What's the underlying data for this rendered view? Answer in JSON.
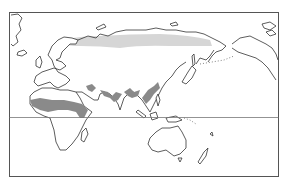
{
  "map": {
    "title": "",
    "projection": "world map, Eurasia-centered, Pacific on right",
    "frame": true,
    "equator_line": true,
    "regions": [
      {
        "name": "Sahel / Saharan belt (Africa)",
        "shade": "dark",
        "color": "#8a8a8a"
      },
      {
        "name": "Horn of Africa / Arabia fringe",
        "shade": "dark",
        "color": "#8a8a8a"
      },
      {
        "name": "South Asia / Indian subcontinent patches",
        "shade": "dark",
        "color": "#8a8a8a"
      },
      {
        "name": "Southeast Asia / South China patches",
        "shade": "dark",
        "color": "#8a8a8a"
      },
      {
        "name": "Northern Eurasia (Siberia) band",
        "shade": "light",
        "color": "#d6d6d6"
      }
    ],
    "colors": {
      "land_fill": "#ffffff",
      "coastline": "#333333",
      "dark_shade": "#8a8a8a",
      "light_shade": "#d6d6d6",
      "frame": "#555555"
    }
  }
}
